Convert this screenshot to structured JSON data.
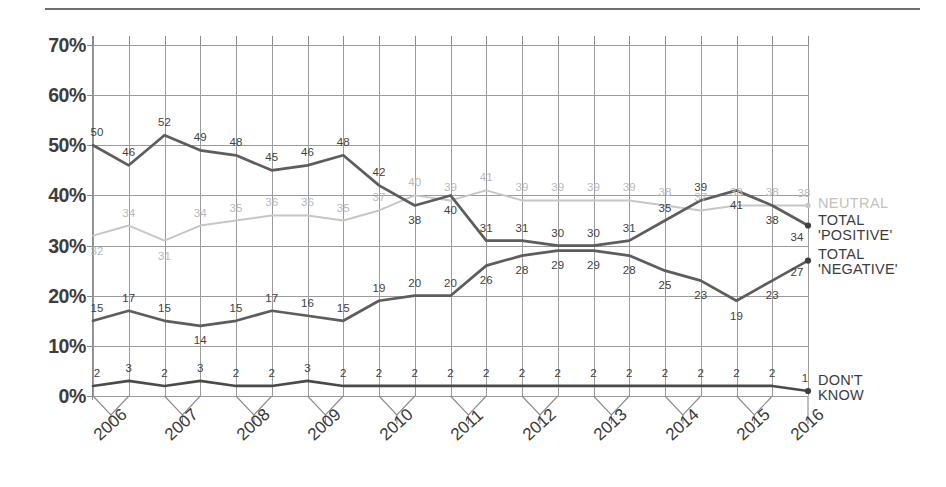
{
  "chart_data": {
    "type": "line",
    "title": "",
    "xlabel": "",
    "ylabel": "",
    "ylim": [
      0,
      70
    ],
    "ytick_labels": [
      "70%",
      "60%",
      "50%",
      "40%",
      "30%",
      "20%",
      "10%",
      "0%"
    ],
    "yticks": [
      70,
      60,
      50,
      40,
      30,
      20,
      10,
      0
    ],
    "grid": true,
    "legend_position": "right",
    "x_group_labels": [
      "2006",
      "2007",
      "2008",
      "2009",
      "2010",
      "2011",
      "2012",
      "2013",
      "2014",
      "2015",
      "2016"
    ],
    "x_points_per_group": [
      2,
      2,
      2,
      2,
      2,
      2,
      2,
      2,
      2,
      2,
      1
    ],
    "n_points": 21,
    "series": [
      {
        "name": "NEUTRAL",
        "color": "#c6c6c6",
        "label_color": "#b9b9b9",
        "values": [
          32,
          34,
          31,
          34,
          35,
          36,
          36,
          35,
          37,
          40,
          39,
          41,
          39,
          39,
          39,
          39,
          38,
          37,
          38,
          38,
          38
        ]
      },
      {
        "name": "TOTAL 'POSITIVE'",
        "color": "#5d5d5d",
        "label_color": "#3f3f3f",
        "values": [
          50,
          46,
          52,
          49,
          48,
          45,
          46,
          48,
          42,
          38,
          40,
          31,
          31,
          30,
          30,
          31,
          35,
          39,
          41,
          38,
          34
        ]
      },
      {
        "name": "TOTAL 'NEGATIVE'",
        "color": "#5d5d5d",
        "label_color": "#3f3f3f",
        "values": [
          15,
          17,
          15,
          14,
          15,
          17,
          16,
          15,
          19,
          20,
          20,
          26,
          28,
          29,
          29,
          28,
          25,
          23,
          19,
          23,
          27
        ]
      },
      {
        "name": "DON'T KNOW",
        "color": "#4a4a4a",
        "label_color": "#3f3f3f",
        "values": [
          2,
          3,
          2,
          3,
          2,
          2,
          3,
          2,
          2,
          2,
          2,
          2,
          2,
          2,
          2,
          2,
          2,
          2,
          2,
          2,
          1
        ]
      }
    ]
  },
  "legend": {
    "neutral": "NEUTRAL",
    "positive_line1": "TOTAL",
    "positive_line2": "'POSITIVE'",
    "negative_line1": "TOTAL",
    "negative_line2": "'NEGATIVE'",
    "dontknow_line1": "DON'T",
    "dontknow_line2": "KNOW"
  },
  "end_labels": {
    "positive": "34",
    "negative": "27"
  },
  "colors": {
    "neutral": "#c6c6c6",
    "dark_line": "#5d5d5d",
    "grid": "#9b9b9b",
    "text": "#3b3b3b"
  }
}
